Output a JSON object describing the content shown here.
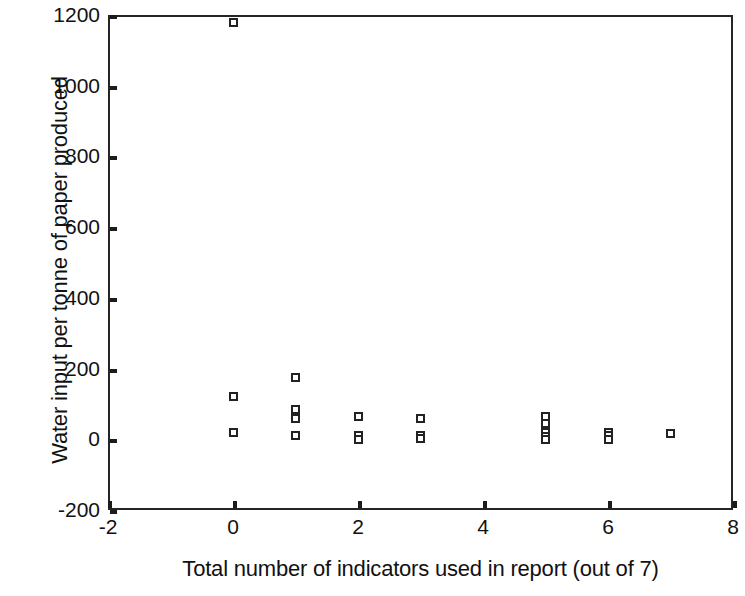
{
  "chart_data": {
    "type": "scatter",
    "title": "",
    "xlabel": "Total number of indicators used in report (out of 7)",
    "ylabel": "Water input per tonne of paper produced",
    "xlim": [
      -2,
      8
    ],
    "ylim": [
      -200,
      1200
    ],
    "xticks": [
      -2,
      0,
      2,
      4,
      6,
      8
    ],
    "yticks": [
      -200,
      0,
      200,
      400,
      600,
      800,
      1000,
      1200
    ],
    "xtick_labels": [
      "-2",
      "0",
      "2",
      "4",
      "6",
      "8"
    ],
    "ytick_labels": [
      "-200",
      "0",
      "200",
      "400",
      "600",
      "800",
      "1000",
      "1200"
    ],
    "grid": false,
    "legend": null,
    "marker": "open-square",
    "marker_color": "#222222",
    "series": [
      {
        "name": "Water input vs indicators",
        "points": [
          [
            0,
            1180
          ],
          [
            0,
            120
          ],
          [
            0,
            20
          ],
          [
            1,
            175
          ],
          [
            1,
            85
          ],
          [
            1,
            60
          ],
          [
            1,
            10
          ],
          [
            2,
            65
          ],
          [
            2,
            10
          ],
          [
            2,
            0
          ],
          [
            3,
            60
          ],
          [
            3,
            12
          ],
          [
            3,
            2
          ],
          [
            5,
            65
          ],
          [
            5,
            45
          ],
          [
            5,
            18
          ],
          [
            5,
            8
          ],
          [
            5,
            0
          ],
          [
            6,
            20
          ],
          [
            6,
            10
          ],
          [
            6,
            0
          ],
          [
            7,
            15
          ]
        ]
      }
    ]
  }
}
